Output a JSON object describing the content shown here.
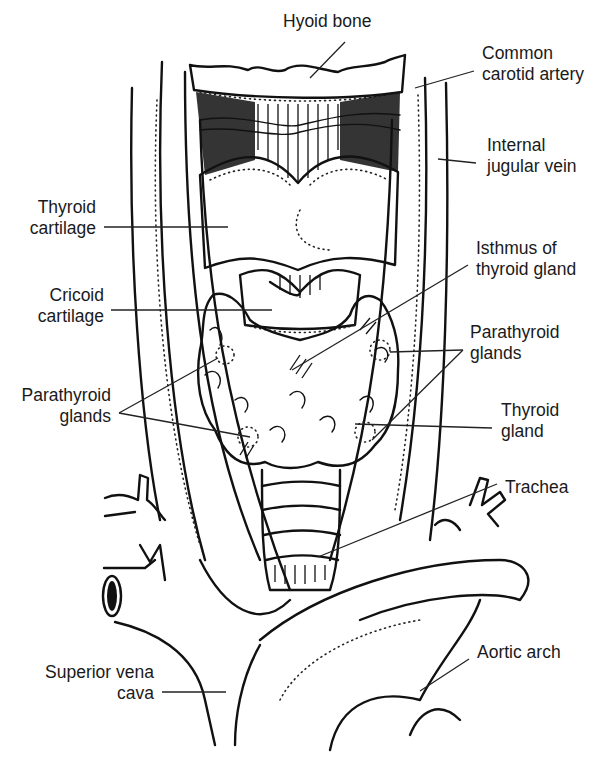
{
  "figure": {
    "style": "black-and-white line illustration"
  },
  "labels": {
    "hyoid_bone": "Hyoid bone",
    "common_carotid_artery": [
      "Common",
      "carotid artery"
    ],
    "internal_jugular_vein": [
      "Internal",
      "jugular vein"
    ],
    "thyroid_cartilage": [
      "Thyroid",
      "cartilage"
    ],
    "isthmus": [
      "Isthmus of",
      "thyroid gland"
    ],
    "cricoid_cartilage": [
      "Cricoid",
      "cartilage"
    ],
    "parathyroid_right": [
      "Parathyroid",
      "glands"
    ],
    "parathyroid_left": [
      "Parathyroid",
      "glands"
    ],
    "thyroid_gland": [
      "Thyroid",
      "gland"
    ],
    "trachea": "Trachea",
    "aortic_arch": "Aortic arch",
    "superior_vena_cava": [
      "Superior vena",
      "cava"
    ]
  },
  "colors": {
    "ink": "#111111",
    "background": "#ffffff"
  }
}
